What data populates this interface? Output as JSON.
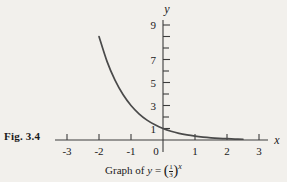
{
  "figure": {
    "label": "Fig. 3.4",
    "caption_prefix": "Graph of ",
    "caption_var": "y",
    "caption_equals": " = ",
    "caption_numerator": "1",
    "caption_denominator": "3",
    "caption_exponent": "x",
    "paren_open": "(",
    "paren_close": ")"
  },
  "colors": {
    "background": "#f2f0ec",
    "curve": "#4a4a4a",
    "axis": "#3c3c3c",
    "text": "#1a1a1a"
  },
  "chart_data": {
    "type": "line",
    "title": "",
    "caption": "Graph of y = (1/3)^x",
    "function": "y = (1/3)^x",
    "xlabel": "x",
    "ylabel": "y",
    "xlim": [
      -3.3,
      3.4
    ],
    "ylim": [
      -0.6,
      9.8
    ],
    "grid": false,
    "legend": null,
    "x_ticks": [
      -3,
      -2,
      -1,
      0,
      1,
      2,
      3
    ],
    "x_tick_labels": [
      "-3",
      "-2",
      "-1",
      "0",
      "1",
      "2",
      "3"
    ],
    "y_ticks": [
      1,
      2,
      3,
      4,
      5,
      6,
      7,
      8,
      9
    ],
    "y_tick_labels": [
      "1",
      "",
      "3",
      "",
      "5",
      "",
      "7",
      "",
      "9"
    ],
    "y_labeled_ticks": [
      1,
      3,
      5,
      7,
      9
    ],
    "series": [
      {
        "name": "y = (1/3)^x",
        "x": [
          -2,
          -1.75,
          -1.5,
          -1.25,
          -1,
          -0.75,
          -0.5,
          -0.25,
          0,
          0.25,
          0.5,
          0.75,
          1,
          1.25,
          1.5,
          1.75,
          2,
          2.25,
          2.5
        ],
        "values": [
          9,
          6.84,
          5.2,
          3.95,
          3,
          2.28,
          1.73,
          1.32,
          1,
          0.76,
          0.577,
          0.439,
          0.333,
          0.253,
          0.192,
          0.146,
          0.111,
          0.0845,
          0.0642
        ]
      }
    ]
  }
}
